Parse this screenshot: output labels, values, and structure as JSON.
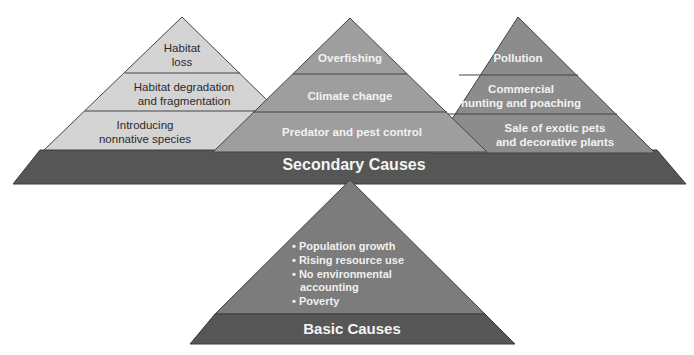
{
  "diagram": {
    "secondary": {
      "label": "Secondary Causes",
      "pyramids": [
        {
          "name": "habitat",
          "layers": [
            "Habitat\nloss",
            "Habitat degradation\nand fragmentation",
            "Introducing\nnonnative species"
          ]
        },
        {
          "name": "climate",
          "layers": [
            "Overfishing",
            "Climate change",
            "Predator and pest control"
          ]
        },
        {
          "name": "pollution",
          "layers": [
            "Pollution",
            "Commercial\nhunting and poaching",
            "Sale of exotic pets\nand decorative plants"
          ]
        }
      ]
    },
    "basic": {
      "label": "Basic Causes",
      "items": [
        "Population growth",
        "Rising resource use",
        "No environmental accounting",
        "Poverty"
      ]
    }
  },
  "colors": {
    "light_pyramid": "#d2d2d2",
    "mid_pyramid": "#9a9a9a",
    "right_pyramid": "#8a8a8a",
    "band": "#555555",
    "basic_pyramid": "#7b7b7b"
  }
}
